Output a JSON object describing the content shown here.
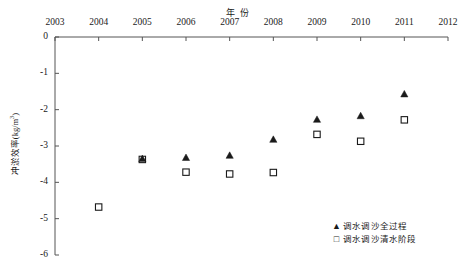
{
  "chart_data": {
    "type": "scatter",
    "title": "年 份",
    "xlabel": "年 份",
    "ylabel": "冲淤效率(kg/m3)",
    "ylabel_base": "冲淤效率(kg/m",
    "ylabel_sup": "3",
    "ylabel_tail": ")",
    "xlim": [
      2003,
      2012
    ],
    "ylim": [
      -6,
      0
    ],
    "grid": false,
    "x_axis_position": "top",
    "legend_position": "bottom-right",
    "x_ticks": [
      "2003",
      "2004",
      "2005",
      "2006",
      "2007",
      "2008",
      "2009",
      "2010",
      "2011",
      "2012"
    ],
    "x_tick_values": [
      2003,
      2004,
      2005,
      2006,
      2007,
      2008,
      2009,
      2010,
      2011,
      2012
    ],
    "y_ticks": [
      "0",
      "-1",
      "-2",
      "-3",
      "-4",
      "-5",
      "-6"
    ],
    "y_tick_values": [
      0,
      -1,
      -2,
      -3,
      -4,
      -5,
      -6
    ],
    "series": [
      {
        "name": "调水调沙全过程",
        "marker": "filled-triangle",
        "color": "#1a1a1a",
        "points": [
          {
            "x": 2005,
            "y": -3.35
          },
          {
            "x": 2006,
            "y": -3.32
          },
          {
            "x": 2007,
            "y": -3.26
          },
          {
            "x": 2008,
            "y": -2.82
          },
          {
            "x": 2009,
            "y": -2.27
          },
          {
            "x": 2010,
            "y": -2.17
          },
          {
            "x": 2011,
            "y": -1.57
          }
        ]
      },
      {
        "name": "调水调沙清水阶段",
        "marker": "open-square",
        "color": "#1a1a1a",
        "points": [
          {
            "x": 2004,
            "y": -4.68
          },
          {
            "x": 2005,
            "y": -3.37
          },
          {
            "x": 2006,
            "y": -3.72
          },
          {
            "x": 2007,
            "y": -3.77
          },
          {
            "x": 2008,
            "y": -3.73
          },
          {
            "x": 2009,
            "y": -2.68
          },
          {
            "x": 2010,
            "y": -2.87
          },
          {
            "x": 2011,
            "y": -2.28
          }
        ]
      }
    ],
    "legend": [
      {
        "marker": "filled-triangle",
        "label": "调水调沙全过程"
      },
      {
        "marker": "open-square",
        "label": "调水调沙清水阶段"
      }
    ]
  }
}
